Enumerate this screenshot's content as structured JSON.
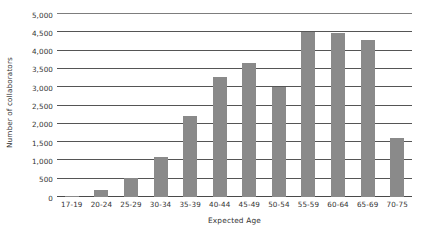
{
  "chart_data": {
    "type": "bar",
    "title": "",
    "xlabel": "Expected Age",
    "ylabel": "Number of collaborators",
    "categories": [
      "17-19",
      "20-24",
      "25-29",
      "30-34",
      "35-39",
      "40-44",
      "45-49",
      "50-54",
      "55-59",
      "60-64",
      "65-69",
      "70-75"
    ],
    "values": [
      30,
      180,
      530,
      1100,
      2200,
      3290,
      3670,
      3000,
      4500,
      4490,
      4280,
      1600
    ],
    "series": [
      {
        "name": "Number of collaborators",
        "values": [
          30,
          180,
          530,
          1100,
          2200,
          3290,
          3670,
          3000,
          4500,
          4490,
          4280,
          1600
        ]
      }
    ],
    "ylim": [
      0,
      5000
    ],
    "ytick_values": [
      0,
      500,
      1000,
      1500,
      2000,
      2500,
      3000,
      3500,
      4000,
      4500,
      5000
    ],
    "ytick_labels": [
      "0",
      "500",
      "1,000",
      "1,500",
      "2,000",
      "2,500",
      "3,000",
      "3,500",
      "4,000",
      "4,500",
      "5,000"
    ],
    "grid": true,
    "grid_axis": "y",
    "legend": false,
    "legend_position": "none",
    "bar_color": "#8a8a8a",
    "gridline_color": "#555555",
    "background_color": "#ffffff",
    "text_color": "#333333"
  }
}
